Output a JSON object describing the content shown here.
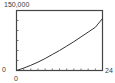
{
  "chart_data": {
    "type": "line",
    "title": "",
    "xlabel": "",
    "ylabel": "",
    "xlim": [
      0,
      24
    ],
    "ylim": [
      0,
      150000
    ],
    "x_tick_labels": [
      "0",
      "24"
    ],
    "y_tick_labels": [
      "0",
      "150,000"
    ],
    "x_tick_step": 2,
    "y_tick_step": 25000,
    "grid": false,
    "legend": null,
    "series": [
      {
        "name": "curve",
        "x": [
          0,
          2,
          4,
          6,
          8,
          10,
          12,
          14,
          16,
          18,
          20,
          22,
          24
        ],
        "y": [
          0,
          6000,
          13000,
          21000,
          30000,
          40000,
          50000,
          61000,
          72000,
          84000,
          96000,
          108000,
          130000
        ]
      }
    ]
  },
  "labels": {
    "y_max": "150,000",
    "y_min": "0",
    "x_min": "0",
    "x_max": "24"
  },
  "colors": {
    "frame": "#444444",
    "curve": "#333333",
    "ticks": "#555555"
  }
}
